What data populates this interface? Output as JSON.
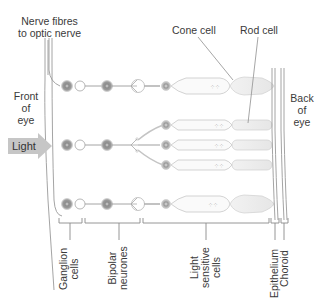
{
  "labels": {
    "nerve_fibres_line1": "Nerve fibres",
    "nerve_fibres_line2": "to optic nerve",
    "front_of_eye_1": "Front",
    "front_of_eye_2": "of",
    "front_of_eye_3": "eye",
    "light": "Light",
    "cone_cell": "Cone cell",
    "rod_cell": "Rod cell",
    "back_of_eye_1": "Back",
    "back_of_eye_2": "of",
    "back_of_eye_3": "eye"
  },
  "bottom_labels": {
    "ganglion_1": "Ganglion",
    "ganglion_2": "cells",
    "bipolar_1": "Bipolar",
    "bipolar_2": "neurones",
    "light_sensitive_1": "Light",
    "light_sensitive_2": "sensitive",
    "light_sensitive_3": "cells",
    "epithelium": "Epithelium",
    "choroid": "Choroid"
  },
  "colors": {
    "line": "#9a9a9a",
    "cell_fill": "#8f8f8f",
    "cell_ring": "#cfcfcf",
    "receptor_fill": "#f3f3f3",
    "arrow_fill": "#c8c8c8",
    "text": "#3a3a3a"
  }
}
